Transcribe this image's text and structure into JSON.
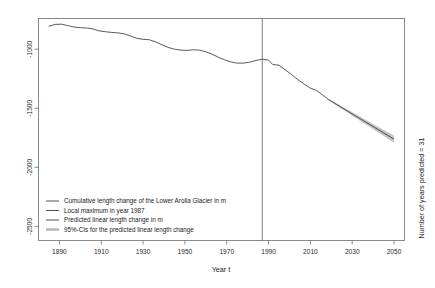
{
  "chart_data": {
    "type": "line",
    "title": "",
    "xlabel": "Year t",
    "ylabel": "",
    "right_label": "Number of years predicted = 31",
    "xlim": [
      1880,
      2055
    ],
    "ylim": [
      -2620,
      -740
    ],
    "xticks": [
      1890,
      1910,
      1930,
      1950,
      1970,
      1990,
      2010,
      2030,
      2050
    ],
    "yticks": [
      -1000,
      -1500,
      -2000,
      -2500
    ],
    "xtick_labels": [
      "1890",
      "1910",
      "1930",
      "1950",
      "1970",
      "1990",
      "2010",
      "2030",
      "2050"
    ],
    "ytick_labels": [
      "-1000",
      "-1500",
      "-2000",
      "-2500"
    ],
    "grid": false,
    "legend_position": "bottom-left",
    "annotations": [
      {
        "name": "local-maximum-vline",
        "x": 1987,
        "label": "Local maximum in year 1987"
      }
    ],
    "colors": {
      "observed_line": "#3c3c3c",
      "vline": "#5a5a5a",
      "prediction_line": "#3c3c3c",
      "ci_band": "#b8b8b8",
      "frame": "#7d7d7d"
    },
    "series": [
      {
        "name": "Cumulative length change of the Lower Arolla Glacier in m",
        "type": "observed",
        "x": [
          1885,
          1888,
          1891,
          1894,
          1897,
          1900,
          1903,
          1906,
          1909,
          1912,
          1915,
          1918,
          1921,
          1924,
          1927,
          1930,
          1933,
          1936,
          1939,
          1942,
          1945,
          1948,
          1951,
          1954,
          1957,
          1960,
          1963,
          1966,
          1969,
          1972,
          1975,
          1978,
          1981,
          1984,
          1987,
          1990,
          1992,
          1995,
          1998,
          2001,
          2004,
          2007,
          2010,
          2013,
          2016,
          2019
        ],
        "y": [
          -805,
          -790,
          -788,
          -800,
          -812,
          -818,
          -820,
          -828,
          -845,
          -852,
          -858,
          -862,
          -870,
          -888,
          -908,
          -916,
          -920,
          -938,
          -962,
          -985,
          -1000,
          -1008,
          -1010,
          -1005,
          -1008,
          -1022,
          -1042,
          -1068,
          -1090,
          -1108,
          -1118,
          -1118,
          -1110,
          -1095,
          -1085,
          -1092,
          -1130,
          -1135,
          -1175,
          -1215,
          -1258,
          -1295,
          -1330,
          -1350,
          -1390,
          -1430
        ]
      },
      {
        "name": "Predicted linear length change in m",
        "type": "prediction",
        "x": [
          2019,
          2026,
          2033,
          2040,
          2047,
          2050
        ],
        "y": [
          -1430,
          -1505,
          -1580,
          -1655,
          -1730,
          -1762
        ]
      },
      {
        "name": "95%-CIs for the predicted linear length change",
        "type": "ci",
        "x": [
          2019,
          2026,
          2033,
          2040,
          2047,
          2050
        ],
        "upper": [
          -1424,
          -1494,
          -1563,
          -1633,
          -1703,
          -1732
        ],
        "lower": [
          -1436,
          -1516,
          -1597,
          -1677,
          -1757,
          -1792
        ]
      }
    ]
  },
  "legend": {
    "items": [
      {
        "label": "Cumulative length change of the Lower Arolla Glacier in m",
        "style": "line",
        "color": "#3c3c3c"
      },
      {
        "label": "Local maximum in year 1987",
        "style": "line",
        "color": "#5a5a5a"
      },
      {
        "label": "Predicted linear length change in m",
        "style": "line",
        "color": "#3c3c3c"
      },
      {
        "label": "95%-CIs for the predicted linear length change",
        "style": "band",
        "color": "#b8b8b8"
      }
    ]
  }
}
